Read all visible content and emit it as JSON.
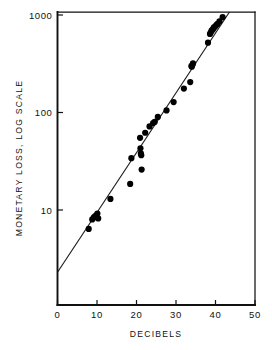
{
  "chart_data": {
    "type": "scatter",
    "title": "",
    "xlabel": "DECIBELS",
    "ylabel": "MONETARY LOSS, LOG SCALE",
    "xscale": "linear",
    "yscale": "log",
    "xlim": [
      0,
      50
    ],
    "ylim": [
      1.8,
      1300
    ],
    "grid": false,
    "legend": null,
    "xticks": [
      0,
      10,
      20,
      30,
      40,
      50
    ],
    "xtick_labels": [
      "0",
      "10",
      "20",
      "30",
      "40",
      "50"
    ],
    "yticks": [
      10,
      100,
      1000
    ],
    "ytick_labels": [
      "10",
      "100",
      "1000"
    ],
    "marker": "filled-circle",
    "marker_color": "#000000",
    "line_color": "#1a1a1a",
    "axis_color": "#111111",
    "background_color": "#ffffff",
    "fit_line": {
      "label": "regression line",
      "x_start": 0.0,
      "y_start": 2.3,
      "x_end": 44.2,
      "y_end": 1180
    },
    "points": [
      {
        "x": 7.9,
        "y": 6.4
      },
      {
        "x": 8.8,
        "y": 8.0
      },
      {
        "x": 9.2,
        "y": 8.4
      },
      {
        "x": 9.5,
        "y": 8.6
      },
      {
        "x": 9.8,
        "y": 8.8
      },
      {
        "x": 10.1,
        "y": 9.2
      },
      {
        "x": 10.3,
        "y": 8.2
      },
      {
        "x": 13.4,
        "y": 13.0
      },
      {
        "x": 18.4,
        "y": 18.5
      },
      {
        "x": 18.7,
        "y": 34.0
      },
      {
        "x": 20.9,
        "y": 55.0
      },
      {
        "x": 21.0,
        "y": 43.0
      },
      {
        "x": 21.1,
        "y": 38.0
      },
      {
        "x": 21.2,
        "y": 36.5
      },
      {
        "x": 21.3,
        "y": 26.0
      },
      {
        "x": 22.2,
        "y": 62.0
      },
      {
        "x": 23.3,
        "y": 72.0
      },
      {
        "x": 24.2,
        "y": 78.0
      },
      {
        "x": 24.6,
        "y": 80.0
      },
      {
        "x": 25.4,
        "y": 90.0
      },
      {
        "x": 27.6,
        "y": 105.0
      },
      {
        "x": 29.4,
        "y": 128.0
      },
      {
        "x": 33.6,
        "y": 205.0
      },
      {
        "x": 33.9,
        "y": 300.0
      },
      {
        "x": 34.0,
        "y": 295.0
      },
      {
        "x": 34.2,
        "y": 310.0
      },
      {
        "x": 34.3,
        "y": 320.0
      },
      {
        "x": 32.0,
        "y": 176.0
      },
      {
        "x": 38.1,
        "y": 520.0
      },
      {
        "x": 38.6,
        "y": 640.0
      },
      {
        "x": 38.8,
        "y": 660.0
      },
      {
        "x": 39.0,
        "y": 690.0
      },
      {
        "x": 39.2,
        "y": 700.0
      },
      {
        "x": 39.4,
        "y": 720.0
      },
      {
        "x": 39.6,
        "y": 745.0
      },
      {
        "x": 39.9,
        "y": 760.0
      },
      {
        "x": 40.2,
        "y": 790.0
      },
      {
        "x": 40.5,
        "y": 810.0
      },
      {
        "x": 41.0,
        "y": 860.0
      },
      {
        "x": 41.8,
        "y": 950.0
      }
    ]
  }
}
